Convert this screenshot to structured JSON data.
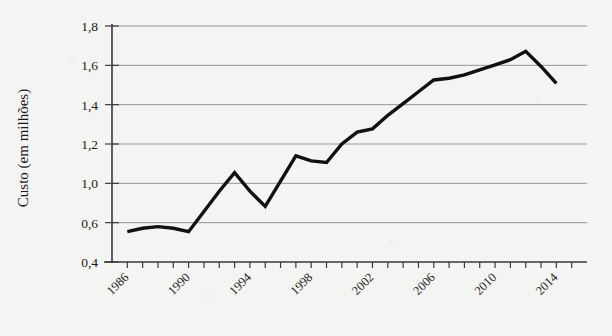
{
  "chart_data": {
    "type": "line",
    "title": "",
    "subtitle": "",
    "xlabel": "",
    "ylabel": "Custo (em milhões)",
    "grid": true,
    "legend": false,
    "legend_position": "none",
    "line_color": "#111111",
    "background_color": "#f4f4f2",
    "grid_color": "#6e6e6e",
    "axis_color": "#3a3a3a",
    "xlim": [
      1985,
      2016
    ],
    "ylim": [
      0.4,
      1.8
    ],
    "x_tick_labels": [
      "1986",
      "1990",
      "1994",
      "1998",
      "2002",
      "2006",
      "2010",
      "2014"
    ],
    "x_tick_values": [
      1986,
      1990,
      1994,
      1998,
      2002,
      2006,
      2010,
      2014
    ],
    "x_minor_tick_step": 1,
    "y_tick_labels": [
      "1,8",
      "1,6",
      "1,4",
      "1,2",
      "1,0",
      "0,6",
      "0,4"
    ],
    "y_tick_values": [
      1.8,
      1.6,
      1.4,
      1.2,
      1.0,
      0.8,
      0.4
    ],
    "x": [
      1986,
      1987,
      1988,
      1989,
      1990,
      1991,
      1992,
      1993,
      1994,
      1995,
      1996,
      1997,
      1998,
      1999,
      2000,
      2001,
      2002,
      2003,
      2004,
      2005,
      2006,
      2007,
      2008,
      2009,
      2010,
      2011,
      2012,
      2013,
      2014
    ],
    "values": [
      0.58,
      0.6,
      0.61,
      0.6,
      0.58,
      0.7,
      0.82,
      0.93,
      0.82,
      0.73,
      0.88,
      1.03,
      1.0,
      0.99,
      1.1,
      1.17,
      1.19,
      1.27,
      1.34,
      1.41,
      1.48,
      1.49,
      1.51,
      1.54,
      1.57,
      1.6,
      1.65,
      1.56,
      1.46
    ],
    "series": [
      {
        "name": "Custo",
        "values": [
          0.58,
          0.6,
          0.61,
          0.6,
          0.58,
          0.7,
          0.82,
          0.93,
          0.82,
          0.73,
          0.88,
          1.03,
          1.0,
          0.99,
          1.1,
          1.17,
          1.19,
          1.27,
          1.34,
          1.41,
          1.48,
          1.49,
          1.51,
          1.54,
          1.57,
          1.6,
          1.65,
          1.56,
          1.46
        ]
      }
    ],
    "annotations": []
  }
}
